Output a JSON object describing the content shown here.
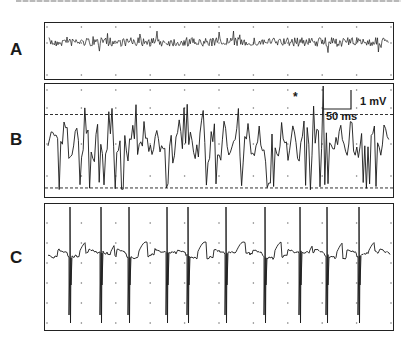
{
  "figure": {
    "top_caption_clipped": true,
    "panels": [
      {
        "id": "A",
        "label": "A"
      },
      {
        "id": "B",
        "label": "B"
      },
      {
        "id": "C",
        "label": "C"
      }
    ],
    "scale_bar": {
      "voltage_label": "1 mV",
      "time_label": "50 ms"
    },
    "annotation": {
      "asterisk": "*"
    },
    "colors": {
      "trace": "#1a1a1a",
      "frame": "#222222",
      "grid_dot": "#777777",
      "background": "#ffffff"
    }
  },
  "chart_data": [
    {
      "type": "line",
      "title": "A",
      "description": "Low-amplitude high-frequency noisy signal trace",
      "xlabel": "",
      "ylabel": "",
      "grid": "dots",
      "grid_columns": 10,
      "amplitude_relative": "low (~0.3 mV)",
      "spikes": []
    },
    {
      "type": "line",
      "title": "B",
      "description": "Irregular high-amplitude signal with dashed threshold lines above and below; asterisk marks largest upward spike",
      "xlabel": "",
      "ylabel": "",
      "grid": "dots",
      "grid_columns": 10,
      "threshold_lines": {
        "upper_frac": 0.27,
        "lower_frac": 0.92,
        "style": "dashed"
      },
      "marked_spike_x_frac": 0.8,
      "annotation": "*",
      "scale_bar": {
        "y": "1 mV",
        "x": "50 ms"
      }
    },
    {
      "type": "line",
      "title": "C",
      "description": "Periodic biphasic spikes (sharp up then deep down) over a slow wavy baseline",
      "xlabel": "",
      "ylabel": "",
      "grid": "dots",
      "grid_columns": 10,
      "spike_x_frac": [
        0.07,
        0.16,
        0.24,
        0.35,
        0.41,
        0.52,
        0.63,
        0.73,
        0.81,
        0.9,
        0.995
      ],
      "spike_count": 11
    }
  ]
}
